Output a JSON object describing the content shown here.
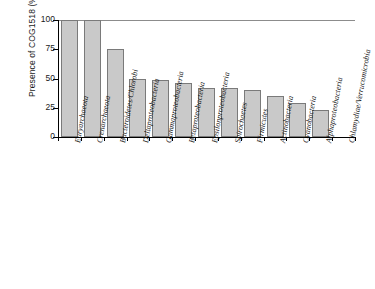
{
  "chart_data": {
    "type": "bar",
    "title": "",
    "xlabel": "",
    "ylabel": "Presence of COG1518 (%)",
    "ylim": [
      0,
      100
    ],
    "yticks": [
      0,
      25,
      50,
      75,
      100
    ],
    "ytick_labels": [
      "0",
      "25",
      "50",
      "75",
      "100"
    ],
    "grid": false,
    "legend": null,
    "categories": [
      "Euryarchaeota",
      "Crenarchaeota",
      "Bacteroidetes/Chlorobi",
      "Deltaproteobacteria",
      "Gammaproteobacteria",
      "Betaproteobacteria",
      "Epsilonproteobacteria",
      "Spirochaetes",
      "Firmicutes",
      "Actinobacteria",
      "Cyanobacteria",
      "Alphaproteobacteria",
      "Chlamydiae/Verrucomicrobia"
    ],
    "values": [
      100,
      100,
      75,
      50,
      49,
      46,
      42,
      42,
      40,
      35,
      29,
      23,
      0
    ],
    "bar_color": "#c9c9c9",
    "bar_edge_color": "#7a7a7a"
  }
}
